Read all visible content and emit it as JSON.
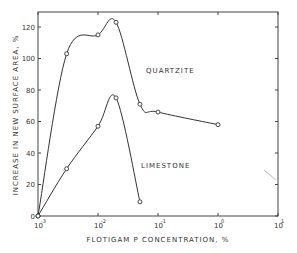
{
  "chart_data": {
    "type": "line",
    "title": "",
    "xlabel": "FLOTIGAM P CONCENTRATION, %",
    "ylabel": "INCREASE IN NEW SURFACE AREA, %",
    "xscale": "log",
    "xlim": [
      0.001,
      10
    ],
    "ylim": [
      0,
      130
    ],
    "x_ticks": [
      {
        "value": 0.001,
        "base": "10",
        "exp": "-3"
      },
      {
        "value": 0.01,
        "base": "10",
        "exp": "-2"
      },
      {
        "value": 0.1,
        "base": "10",
        "exp": "-1"
      },
      {
        "value": 1,
        "base": "10",
        "exp": "0"
      },
      {
        "value": 10,
        "base": "10",
        "exp": "1"
      }
    ],
    "y_ticks": [
      0,
      20,
      40,
      60,
      80,
      100,
      120
    ],
    "grid": false,
    "legend": "inline labels",
    "series": [
      {
        "name": "QUARTZITE",
        "x": [
          0.001,
          0.003,
          0.01,
          0.02,
          0.05,
          0.1,
          1
        ],
        "values": [
          0,
          103,
          115,
          123,
          71,
          66,
          58
        ]
      },
      {
        "name": "LIMESTONE",
        "x": [
          0.001,
          0.003,
          0.01,
          0.02,
          0.05
        ],
        "values": [
          0,
          30,
          57,
          75,
          9
        ]
      }
    ]
  }
}
